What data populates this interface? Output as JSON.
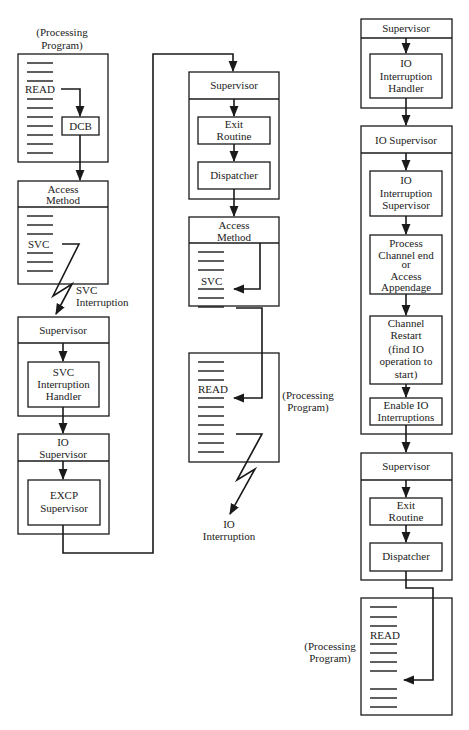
{
  "diagram": {
    "column1": {
      "processing_program": {
        "caption_line1": "(Processing",
        "caption_line2": "Program)",
        "statement": "READ",
        "dcb_label": "DCB"
      },
      "access_method": {
        "title_line1": "Access",
        "title_line2": "Method",
        "statement": "SVC"
      },
      "svc_interruption": {
        "line1": "SVC",
        "line2": "Interruption"
      },
      "supervisor": {
        "title": "Supervisor",
        "handler_line1": "SVC",
        "handler_line2": "Interruption",
        "handler_line3": "Handler"
      },
      "io_supervisor": {
        "title_line1": "IO",
        "title_line2": "Supervisor",
        "excp_line1": "EXCP",
        "excp_line2": "Supervisor"
      }
    },
    "column2": {
      "supervisor": {
        "title": "Supervisor",
        "exit_line1": "Exit",
        "exit_line2": "Routine",
        "dispatcher": "Dispatcher"
      },
      "access_method": {
        "title_line1": "Access",
        "title_line2": "Method",
        "statement": "SVC"
      },
      "processing_program": {
        "caption_line1": "(Processing",
        "caption_line2": "Program)",
        "statement": "READ"
      },
      "io_interruption": {
        "line1": "IO",
        "line2": "Interruption"
      }
    },
    "column3": {
      "supervisor_top": {
        "title": "Supervisor",
        "handler_line1": "IO",
        "handler_line2": "Interruption",
        "handler_line3": "Handler"
      },
      "io_supervisor": {
        "title": "IO Supervisor",
        "ios_line1": "IO",
        "ios_line2": "Interruption",
        "ios_line3": "Supervisor",
        "proc_line1": "Process",
        "proc_line2": "Channel end",
        "proc_line3": "or",
        "proc_line4": "Access",
        "proc_line5": "Appendage",
        "restart_line1": "Channel",
        "restart_line2": "Restart",
        "restart_line3": "(find IO",
        "restart_line4": "operation to",
        "restart_line5": "start)",
        "enable_line1": "Enable IO",
        "enable_line2": "Interruptions"
      },
      "supervisor_bottom": {
        "title": "Supervisor",
        "exit_line1": "Exit",
        "exit_line2": "Routine",
        "dispatcher": "Dispatcher"
      },
      "processing_program": {
        "caption_line1": "(Processing",
        "caption_line2": "Program)",
        "statement": "READ"
      }
    }
  }
}
